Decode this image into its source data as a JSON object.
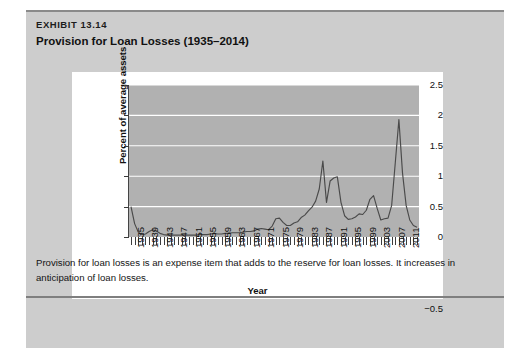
{
  "exhibit": {
    "label": "EXHIBIT 13.14",
    "title": "Provision for Loan Losses (1935–2014)",
    "footer_note": "Provision for loan losses is an expense item that adds to the reserve for loan losses. It increases in anticipation of loan losses."
  },
  "chart_data": {
    "type": "line",
    "title": "Provision for Loan Losses (1935–2014)",
    "xlabel": "Year",
    "ylabel": "Percent of average assets",
    "xlim": [
      1935,
      2014
    ],
    "ylim": [
      -0.5,
      2.5
    ],
    "ytick_labels": [
      "2.5",
      "2",
      "1.5",
      "1",
      "0.5",
      "0",
      "-0.5"
    ],
    "ytick_values": [
      2.5,
      2,
      1.5,
      1,
      0.5,
      0,
      -0.5
    ],
    "xtick_labels": [
      "1935",
      "1939",
      "1943",
      "1947",
      "1951",
      "1955",
      "1959",
      "1963",
      "1967",
      "1971",
      "1975",
      "1979",
      "1983",
      "1987",
      "1991",
      "1995",
      "1999",
      "2003",
      "2007",
      "2011"
    ],
    "xtick_values": [
      1935,
      1939,
      1943,
      1947,
      1951,
      1955,
      1959,
      1963,
      1967,
      1971,
      1975,
      1979,
      1983,
      1987,
      1991,
      1995,
      1999,
      2003,
      2007,
      2011
    ],
    "grid": "horizontal-white",
    "legend": "none",
    "plot_background": "#b1b1b1",
    "line_color": "#4a4a4a",
    "series": [
      {
        "name": "Provision for loan losses",
        "x": [
          1935,
          1936,
          1937,
          1938,
          1939,
          1940,
          1941,
          1942,
          1943,
          1944,
          1945,
          1946,
          1947,
          1948,
          1949,
          1950,
          1951,
          1952,
          1953,
          1954,
          1955,
          1956,
          1957,
          1958,
          1959,
          1960,
          1961,
          1962,
          1963,
          1964,
          1965,
          1966,
          1967,
          1968,
          1969,
          1970,
          1971,
          1972,
          1973,
          1974,
          1975,
          1976,
          1977,
          1978,
          1979,
          1980,
          1981,
          1982,
          1983,
          1984,
          1985,
          1986,
          1987,
          1988,
          1989,
          1990,
          1991,
          1992,
          1993,
          1994,
          1995,
          1996,
          1997,
          1998,
          1999,
          2000,
          2001,
          2002,
          2003,
          2004,
          2005,
          2006,
          2007,
          2008,
          2009,
          2010,
          2011,
          2012,
          2013,
          2014
        ],
        "values": [
          0.5,
          0.22,
          0.08,
          0.04,
          0.05,
          0.09,
          0.12,
          0.1,
          0.06,
          0.04,
          0.03,
          0.03,
          0.03,
          0.03,
          0.03,
          0.03,
          0.03,
          0.03,
          0.03,
          0.04,
          0.04,
          0.04,
          0.05,
          0.06,
          0.05,
          0.05,
          0.06,
          0.06,
          0.07,
          0.07,
          0.07,
          0.08,
          0.09,
          0.09,
          0.1,
          0.13,
          0.14,
          0.13,
          0.12,
          0.18,
          0.3,
          0.31,
          0.24,
          0.19,
          0.19,
          0.23,
          0.25,
          0.32,
          0.36,
          0.43,
          0.49,
          0.59,
          0.79,
          1.25,
          0.57,
          0.92,
          0.97,
          0.99,
          0.57,
          0.35,
          0.29,
          0.3,
          0.33,
          0.38,
          0.37,
          0.44,
          0.62,
          0.68,
          0.47,
          0.28,
          0.3,
          0.31,
          0.52,
          1.22,
          1.93,
          1.05,
          0.52,
          0.28,
          0.19,
          0.16
        ]
      }
    ],
    "annotations": [
      {
        "label": "1935 start",
        "x": 1935,
        "y": 0.5
      },
      {
        "label": "1988 peak",
        "x": 1988,
        "y": 1.25
      },
      {
        "label": "2009 peak",
        "x": 2009,
        "y": 1.93
      }
    ]
  }
}
